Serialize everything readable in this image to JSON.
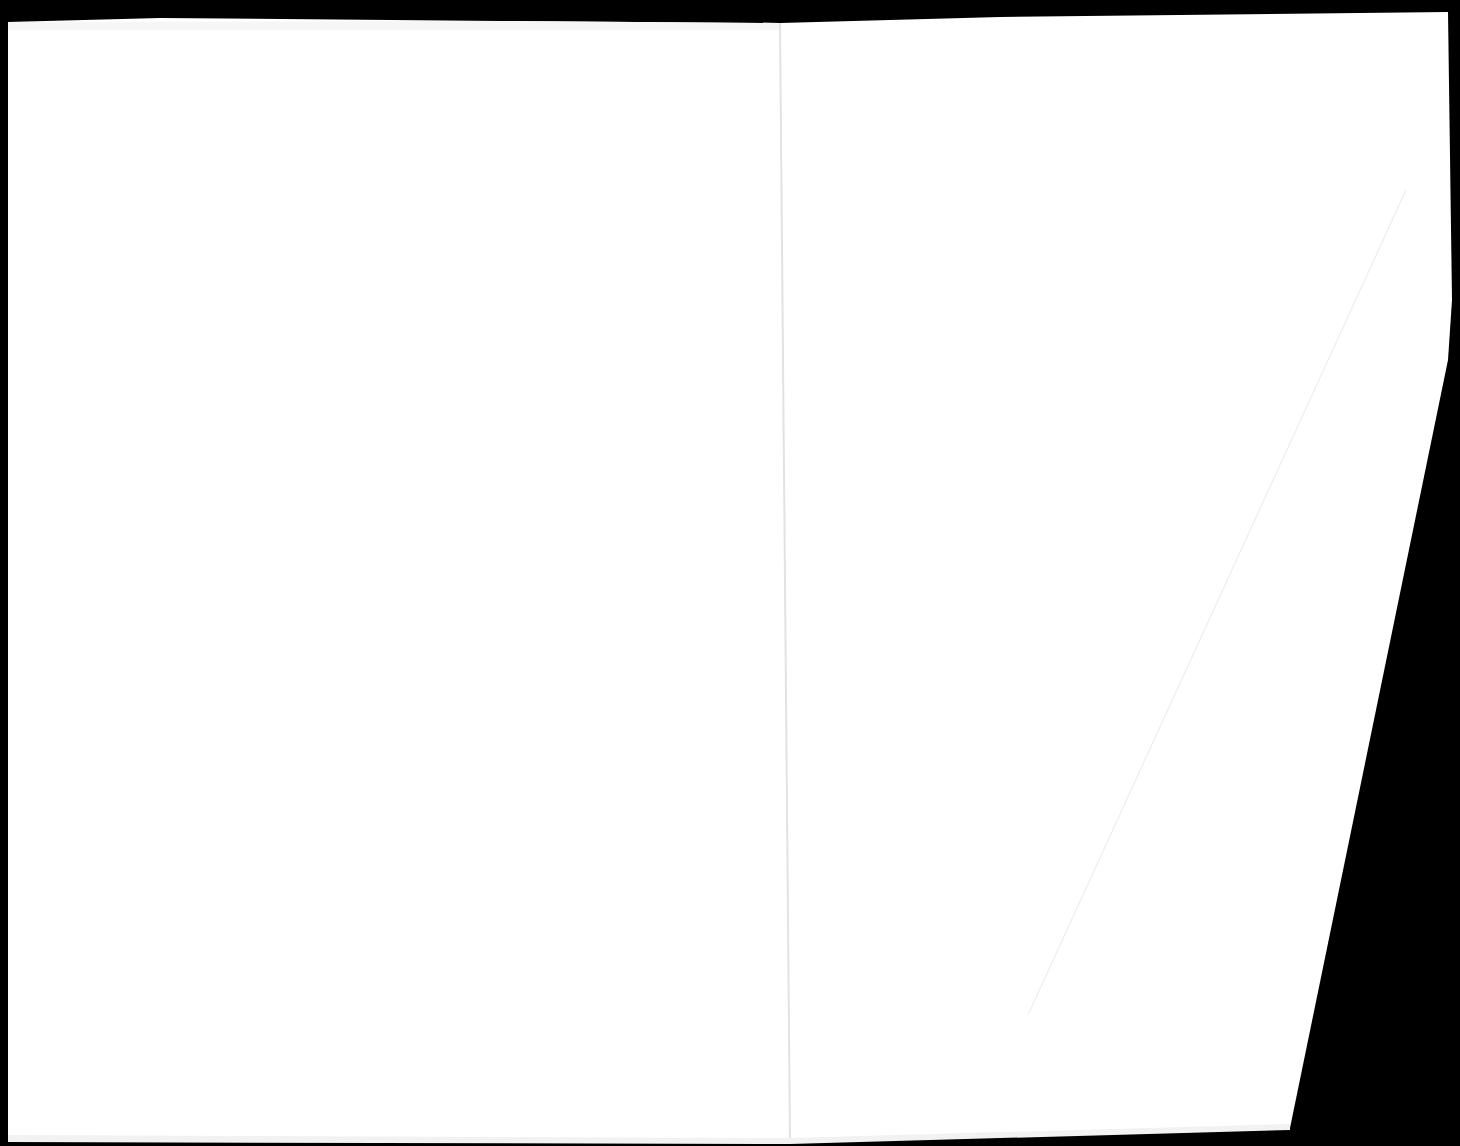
{
  "document": {
    "type": "scanned-two-page-spread",
    "background_color": "#000000",
    "page_color": "#ffffff",
    "gutter_color": "#e6e6e6",
    "crease_color": "#ececec",
    "pages": [
      {
        "side": "left",
        "content": ""
      },
      {
        "side": "right",
        "content": ""
      }
    ]
  }
}
